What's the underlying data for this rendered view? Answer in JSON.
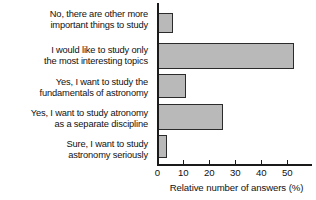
{
  "chart_data": {
    "type": "bar",
    "orientation": "horizontal",
    "title": "",
    "subtitle": "",
    "xlabel": "Relative number of answers (%)",
    "ylabel": "",
    "categories": [
      "No, there are other more\nimportant things to study",
      "I would like to study only\nthe most interesting topics",
      "Yes, I want to study the\nfundamentals of astronomy",
      "Yes, I want to study atronomy\nas a separate discipline",
      "Sure, I want to study\nastronomy seriously"
    ],
    "values": [
      6,
      52.5,
      11,
      25.5,
      4
    ],
    "xlim": [
      0,
      57
    ],
    "xticks": [
      0,
      10,
      20,
      30,
      40,
      50
    ],
    "xtick_labels": [
      "0",
      "10",
      "20",
      "30",
      "40",
      "50"
    ],
    "grid": false,
    "legend": false,
    "bar_fill_color": "#b9b9b9",
    "bar_edge_color": "#2b2b2b",
    "axis_color": "#1a1a1a",
    "background_color": "#ffffff"
  }
}
